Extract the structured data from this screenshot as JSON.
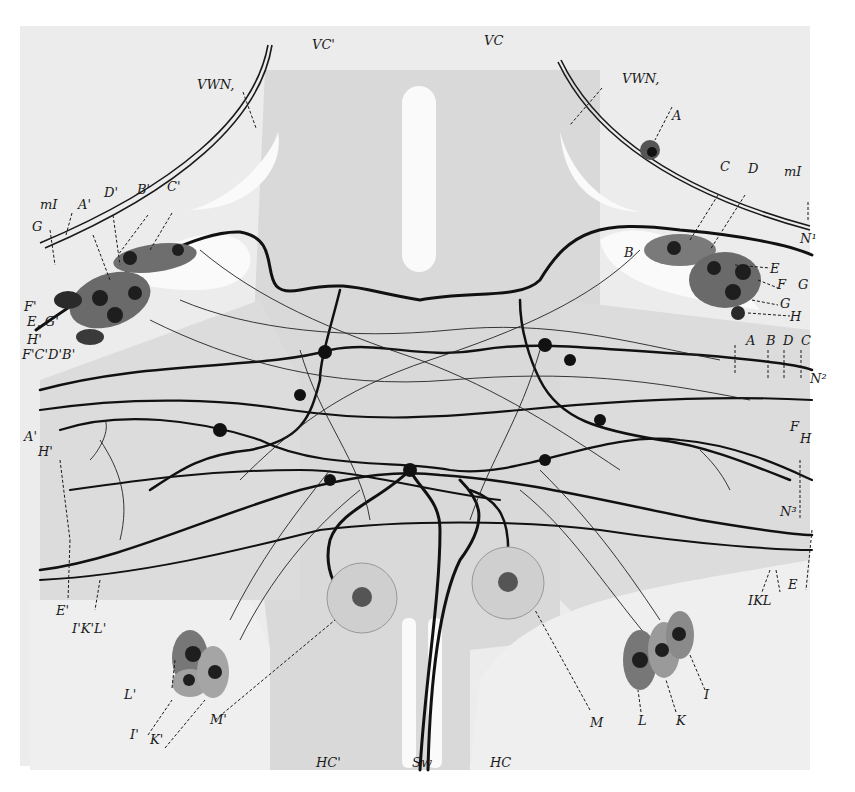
{
  "figure": {
    "colors": {
      "background": "#ffffff",
      "plate": "#ececec",
      "tissue_dark": "#d9d9d9",
      "cavity": "#fafafa",
      "fibre": "#111111",
      "cell_body": "#6e6e6e",
      "nucleus": "#1e1e1e",
      "large_cell": "#cfcfcf"
    }
  },
  "labels": {
    "top": {
      "vc_left": "VC'",
      "vc_right": "VC",
      "vwn_left": "VWN,",
      "vwn_right": "VWN,",
      "a_right_top": "A"
    },
    "left_cluster": {
      "mI": "mI",
      "G": "G",
      "A_prime": "A'",
      "D_prime": "D'",
      "B_prime": "B'",
      "C_prime": "C'",
      "F_prime": "F'",
      "E_G_prime": "E, G'",
      "H_prime": "H'",
      "FCDB_prime": "F'C'D'B'"
    },
    "right_cluster": {
      "C": "C",
      "D": "D",
      "mI": "mI",
      "N1": "N¹",
      "B": "B",
      "E": "E",
      "F": "F",
      "G1": "G",
      "G2": "G",
      "H": "H",
      "A": "A",
      "B2": "B",
      "D2": "D",
      "C2": "C",
      "N2": "N²"
    },
    "left_lower": {
      "A_prime_H": "A'",
      "H_prime": "H'",
      "E_prime": "E'",
      "IKL_prime": "I'K'L'",
      "L_prime": "L'",
      "I_prime": "I'",
      "K_prime": "K'",
      "M_prime": "M'"
    },
    "right_lower": {
      "F": "F",
      "H": "H",
      "N3": "N³",
      "IKL": "IKL",
      "E": "E",
      "M": "M",
      "L": "L",
      "K": "K",
      "I": "I"
    },
    "bottom": {
      "hc_left": "HC'",
      "sw": "Sw",
      "hc_right": "HC"
    }
  }
}
